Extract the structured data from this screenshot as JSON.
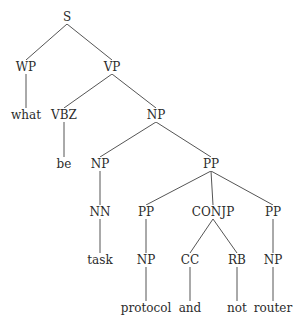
{
  "diagram": {
    "type": "constituency-parse-tree",
    "sentence": [
      "what",
      "be",
      "task",
      "protocol",
      "and",
      "not",
      "router"
    ],
    "colors": {
      "text": "#2b2b2b",
      "edge": "#555555",
      "background": "#ffffff"
    },
    "nodes": [
      {
        "id": "n0",
        "label": "S",
        "x": 67,
        "y": 17,
        "kind": "phrase"
      },
      {
        "id": "n1",
        "label": "WP",
        "x": 26,
        "y": 67,
        "kind": "pos"
      },
      {
        "id": "n2",
        "label": "VP",
        "x": 112,
        "y": 67,
        "kind": "phrase"
      },
      {
        "id": "n3",
        "label": "what",
        "x": 26,
        "y": 115,
        "kind": "word"
      },
      {
        "id": "n4",
        "label": "VBZ",
        "x": 64,
        "y": 115,
        "kind": "pos"
      },
      {
        "id": "n5",
        "label": "NP",
        "x": 156,
        "y": 115,
        "kind": "phrase"
      },
      {
        "id": "n6",
        "label": "be",
        "x": 64,
        "y": 164,
        "kind": "word"
      },
      {
        "id": "n7",
        "label": "NP",
        "x": 100,
        "y": 164,
        "kind": "phrase"
      },
      {
        "id": "n8",
        "label": "PP",
        "x": 211,
        "y": 164,
        "kind": "phrase"
      },
      {
        "id": "n9",
        "label": "NN",
        "x": 100,
        "y": 212,
        "kind": "pos"
      },
      {
        "id": "n10",
        "label": "PP",
        "x": 146,
        "y": 212,
        "kind": "phrase"
      },
      {
        "id": "n11",
        "label": "CONJP",
        "x": 213,
        "y": 212,
        "kind": "phrase"
      },
      {
        "id": "n12",
        "label": "PP",
        "x": 273,
        "y": 212,
        "kind": "phrase"
      },
      {
        "id": "n13",
        "label": "task",
        "x": 100,
        "y": 260,
        "kind": "word"
      },
      {
        "id": "n14",
        "label": "NP",
        "x": 146,
        "y": 260,
        "kind": "phrase"
      },
      {
        "id": "n15",
        "label": "CC",
        "x": 190,
        "y": 260,
        "kind": "pos"
      },
      {
        "id": "n16",
        "label": "RB",
        "x": 237,
        "y": 260,
        "kind": "pos"
      },
      {
        "id": "n17",
        "label": "NP",
        "x": 273,
        "y": 260,
        "kind": "phrase"
      },
      {
        "id": "n18",
        "label": "protocol",
        "x": 146,
        "y": 308,
        "kind": "word"
      },
      {
        "id": "n19",
        "label": "and",
        "x": 190,
        "y": 308,
        "kind": "word"
      },
      {
        "id": "n20",
        "label": "not",
        "x": 237,
        "y": 308,
        "kind": "word"
      },
      {
        "id": "n21",
        "label": "router",
        "x": 273,
        "y": 308,
        "kind": "word"
      }
    ],
    "edges": [
      [
        "n0",
        "n1"
      ],
      [
        "n0",
        "n2"
      ],
      [
        "n1",
        "n3"
      ],
      [
        "n2",
        "n4"
      ],
      [
        "n2",
        "n5"
      ],
      [
        "n4",
        "n6"
      ],
      [
        "n5",
        "n7"
      ],
      [
        "n5",
        "n8"
      ],
      [
        "n7",
        "n9"
      ],
      [
        "n9",
        "n13"
      ],
      [
        "n8",
        "n10"
      ],
      [
        "n8",
        "n11"
      ],
      [
        "n8",
        "n12"
      ],
      [
        "n10",
        "n14"
      ],
      [
        "n14",
        "n18"
      ],
      [
        "n11",
        "n15"
      ],
      [
        "n11",
        "n16"
      ],
      [
        "n15",
        "n19"
      ],
      [
        "n16",
        "n20"
      ],
      [
        "n12",
        "n17"
      ],
      [
        "n17",
        "n21"
      ]
    ]
  }
}
